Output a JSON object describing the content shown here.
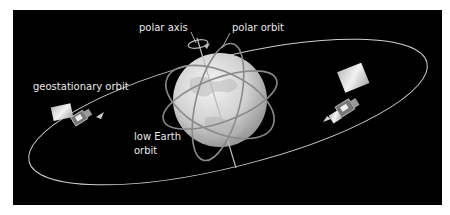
{
  "labels": {
    "polar_axis": "polar axis",
    "polar_orbit": "polar orbit",
    "geostationary_orbit": "geostationary orbit",
    "low_earth_orbit_line1": "low Earth",
    "low_earth_orbit_line2": "orbit"
  },
  "colors": {
    "background": "#000000",
    "border": "#ffffff",
    "orbit_line": "#cfcfcf",
    "earth": "#d9d9d9",
    "text": "#e8e8e8"
  }
}
